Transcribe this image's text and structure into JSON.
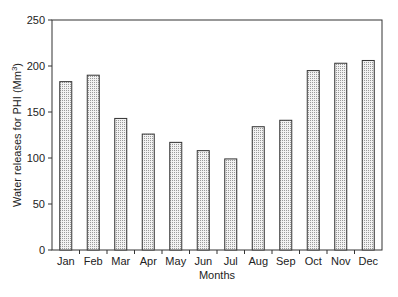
{
  "chart_data": {
    "type": "bar",
    "title": "",
    "xlabel": "Months",
    "ylabel": "Water releases for PHI (Mm³)",
    "ylabel_parts": {
      "main": "Water releases for PHI (Mm",
      "sup": "3",
      "end": ")"
    },
    "categories": [
      "Jan",
      "Feb",
      "Mar",
      "Apr",
      "May",
      "Jun",
      "Jul",
      "Aug",
      "Sep",
      "Oct",
      "Nov",
      "Dec"
    ],
    "values": [
      183,
      190,
      143,
      126,
      117,
      108,
      99,
      134,
      141,
      195,
      203,
      206
    ],
    "ylim": [
      0,
      250
    ],
    "yticks": [
      0,
      50,
      100,
      150,
      200,
      250
    ],
    "grid": false,
    "legend": "none",
    "bar_fill": "dotted light gray",
    "colors": {
      "bar_edge": "#333333",
      "bar_dot": "#9a9a9a",
      "axis": "#333333"
    }
  }
}
